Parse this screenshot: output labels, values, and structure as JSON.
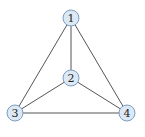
{
  "diagram": {
    "type": "graph",
    "node_fill": "#dce9f5",
    "node_stroke": "#7d9cc0",
    "edge_color": "#555555",
    "nodes": [
      {
        "id": "1",
        "label": "1",
        "x": 71,
        "y": 18
      },
      {
        "id": "2",
        "label": "2",
        "x": 71,
        "y": 78
      },
      {
        "id": "3",
        "label": "3",
        "x": 15,
        "y": 113
      },
      {
        "id": "4",
        "label": "4",
        "x": 127,
        "y": 113
      }
    ],
    "edges": [
      [
        "1",
        "2"
      ],
      [
        "1",
        "3"
      ],
      [
        "1",
        "4"
      ],
      [
        "2",
        "3"
      ],
      [
        "2",
        "4"
      ],
      [
        "3",
        "4"
      ]
    ]
  }
}
